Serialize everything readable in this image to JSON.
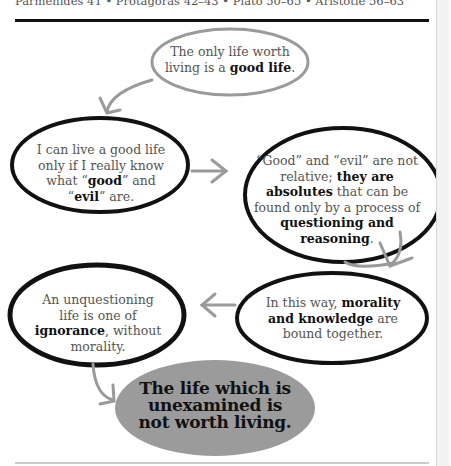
{
  "header": {
    "cross_references": "Parmenides 41 • Protagoras 42–43 • Plato 50–65 • Aristotle 56–63"
  },
  "diagram": {
    "nodes": [
      {
        "id": "good-life",
        "parts": [
          {
            "text": "The only life worth living is a ",
            "bold": false
          },
          {
            "text": "good life",
            "bold": true
          },
          {
            "text": ".",
            "bold": false
          }
        ],
        "outline_color": "#9a9a9a"
      },
      {
        "id": "know-good-evil",
        "parts": [
          {
            "text": "I can live a good life only if I really know what “",
            "bold": false
          },
          {
            "text": "good",
            "bold": true
          },
          {
            "text": "” and “",
            "bold": false
          },
          {
            "text": "evil",
            "bold": true
          },
          {
            "text": "” are.",
            "bold": false
          }
        ],
        "outline_color": "#111111"
      },
      {
        "id": "absolutes",
        "parts": [
          {
            "text": "“Good” and “evil” are not relative; ",
            "bold": false
          },
          {
            "text": "they are absolutes",
            "bold": true
          },
          {
            "text": " that can be found only by a process of ",
            "bold": false
          },
          {
            "text": "questioning and reasoning",
            "bold": true
          },
          {
            "text": ".",
            "bold": false
          }
        ],
        "outline_color": "#111111"
      },
      {
        "id": "morality-knowledge",
        "parts": [
          {
            "text": "In this way, ",
            "bold": false
          },
          {
            "text": "morality and knowledge",
            "bold": true
          },
          {
            "text": " are bound together.",
            "bold": false
          }
        ],
        "outline_color": "#111111"
      },
      {
        "id": "ignorance",
        "parts": [
          {
            "text": "An unquestioning life is one of ",
            "bold": false
          },
          {
            "text": "ignorance",
            "bold": true
          },
          {
            "text": ", without morality.",
            "bold": false
          }
        ],
        "outline_color": "#111111"
      },
      {
        "id": "conclusion",
        "parts": [
          {
            "text": "The life which is unexamined is not worth living.",
            "bold": true
          }
        ],
        "fill_color": "#9b9b9b"
      }
    ],
    "edges": [
      {
        "from": "good-life",
        "to": "know-good-evil"
      },
      {
        "from": "know-good-evil",
        "to": "absolutes"
      },
      {
        "from": "absolutes",
        "to": "morality-knowledge"
      },
      {
        "from": "morality-knowledge",
        "to": "ignorance"
      },
      {
        "from": "ignorance",
        "to": "conclusion"
      }
    ],
    "arrow_color": "#9a9a9a"
  }
}
